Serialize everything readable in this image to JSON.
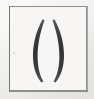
{
  "image": {
    "kind": "glyph-specimen",
    "width": 94,
    "height": 99,
    "description": "Pair of parentheses inside a thin rectangular box frame",
    "alt_text": "( )",
    "caption": ""
  },
  "colors": {
    "page_background": "#ffffff",
    "paper_background": "#f2f1ef",
    "frame_fill": "#f7f6f4",
    "frame_stroke": "#8d8d8d",
    "glyph_ink": "#3a3a3a",
    "speck": "#b9b7b3"
  },
  "frame": {
    "name": "box-border",
    "x": 9,
    "y": 6,
    "width": 78,
    "height": 85,
    "stroke_width": 1
  },
  "glyphs": [
    {
      "name": "left-parenthesis",
      "character": "(",
      "unicode": "U+0028",
      "x": 28,
      "y": 19,
      "width": 14,
      "height": 63,
      "max_stroke_width": 5
    },
    {
      "name": "right-parenthesis",
      "character": ")",
      "unicode": "U+0029",
      "x": 54,
      "y": 19,
      "width": 14,
      "height": 63,
      "max_stroke_width": 5
    }
  ],
  "specks": [
    {
      "x": 13,
      "y": 52,
      "size": 2,
      "opacity": 0.55
    },
    {
      "x": 15,
      "y": 55,
      "size": 1,
      "opacity": 0.4
    },
    {
      "x": 78,
      "y": 26,
      "size": 1,
      "opacity": 0.3
    },
    {
      "x": 46,
      "y": 87,
      "size": 1,
      "opacity": 0.3
    }
  ]
}
